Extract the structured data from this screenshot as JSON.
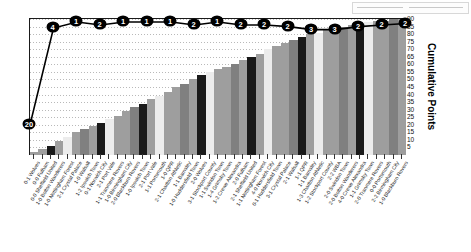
{
  "chart_data": {
    "type": "bar",
    "title": "",
    "xlabel": "",
    "ylabel": "Cumulative Points",
    "ylim": [
      0,
      90
    ],
    "ytick_labels": [
      "90",
      "85",
      "80",
      "75",
      "70",
      "65",
      "60",
      "55",
      "50",
      "45",
      "40",
      "35",
      "30",
      "25",
      "20",
      "15",
      "10",
      "5"
    ],
    "ytick_values": [
      90,
      85,
      80,
      75,
      70,
      65,
      60,
      55,
      50,
      45,
      40,
      35,
      30,
      25,
      20,
      15,
      10,
      5
    ],
    "grid": true,
    "legend_position": "none",
    "categories": [
      "0-1 Wolves",
      "0-0 Fulham",
      "0-0 Sheffield United",
      "1-0 Bolton Wanderers",
      "1-0 Nottingham Forest",
      "2-1 Crystal Palace",
      "1-0 Walsall",
      "1-2 Ipswich Town",
      "0-1 Norwich City",
      "2-1 Port Vale",
      "1-1 Tranmere Rovers",
      "1-0 Birmingham City",
      "2-0 Blackburn Rovers",
      "1-0 Ipswich Town",
      "2-1 Port Vale",
      "1-1 Portsmouth",
      "1-0 QPR",
      "2-1 Charlton Athletic",
      "1-1 Barnsley",
      "1-0 Huddersfield Town",
      "2-0 Wolves",
      "3-1 Stockport County",
      "1-1 Swindon Town",
      "1-4 Grimsby Town",
      "1-2 Crewe Alexandra",
      "2-0 Fulham",
      "2-1 Sheffield United",
      "1-1 Nottingham Forest",
      "4-0 Norwich City",
      "0-1 Huddersfield Town",
      "3-1 Crystal Palace",
      "2-1 Walsall",
      "1-1 QPR",
      "1-1 Barnsley",
      "1-3 Charlton Athletic",
      "1-2 Stockport County",
      "2-2 WBA",
      "2-0 Swindon Town",
      "2-0 Bolton Wanderers",
      "4-0 Crewe Alexandra",
      "1-1 Grimsby Town",
      "2-0 Tranmere Rovers",
      "0-0 Portsmouth",
      "2-2 Birmingham City",
      "1-0 Blackburn Rovers"
    ],
    "bar_values": [
      2,
      4,
      6,
      9,
      12,
      15,
      17,
      19,
      21,
      24,
      26,
      29,
      32,
      34,
      37,
      39,
      42,
      45,
      47,
      50,
      53,
      55,
      57,
      58,
      60,
      63,
      65,
      67,
      70,
      72,
      74,
      76,
      78,
      80,
      81,
      83,
      84,
      85,
      86,
      87,
      88,
      89,
      89,
      90,
      90
    ],
    "cumulative_series_name": "Cumulative Points",
    "line_point_labels": [
      "20",
      "4",
      "1",
      "2",
      "1",
      "1",
      "1",
      "2",
      "1",
      "2",
      "2",
      "2",
      "3",
      "3",
      "2",
      "2",
      "2"
    ],
    "line_point_values": [
      20,
      84,
      88,
      86,
      88,
      88,
      88,
      86,
      88,
      86,
      86,
      85,
      83,
      83,
      85,
      86,
      87
    ],
    "bar_colors": [
      "#9e9e9e",
      "#1a1a1a",
      "#ececec",
      "#bdbdbd",
      "#808080"
    ],
    "line_color": "#000000",
    "marker_fill": "#000000",
    "marker_text_color": "#ffffff"
  },
  "axis": {
    "y_title": "Cumulative Points"
  },
  "top_strip": {
    "present": true
  }
}
